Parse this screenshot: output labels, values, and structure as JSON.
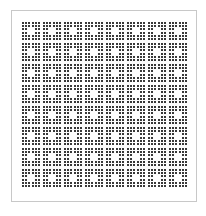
{
  "pattern": {
    "block_rows": 8,
    "block_cols": 8,
    "dots_per_block": 6,
    "hole": [
      2,
      3
    ],
    "dot_color": "#3a3a3a",
    "frame_color": "#c8c8c8"
  }
}
